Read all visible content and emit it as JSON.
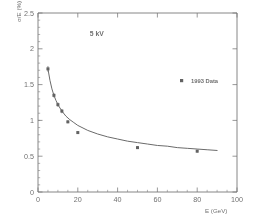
{
  "figure": {
    "axis_titles": {
      "y": "σ/E (%)",
      "x": "E  (GeV)"
    },
    "annotation": "5 kV",
    "legend": {
      "marker_icon": "filled-square-marker",
      "label": "1993 Data"
    },
    "colors": {
      "frame": "#3a3a3a",
      "curve": "#262626",
      "marker": "#1a1a1a",
      "background": "#ffffff"
    }
  },
  "chart_data": {
    "type": "scatter",
    "title": "",
    "subtitle": "",
    "xlabel": "E  (GeV)",
    "ylabel": "σ/E (%)",
    "xlim": [
      0,
      100
    ],
    "ylim": [
      0,
      2.5
    ],
    "grid": false,
    "legend_position": "upper-right-inside",
    "xticks": [
      0,
      20,
      40,
      60,
      80,
      100
    ],
    "xtick_labels": [
      "0",
      "20",
      "40",
      "60",
      "80",
      "100"
    ],
    "xtick_minor_step": 5,
    "yticks": [
      0,
      0.5,
      1,
      1.5,
      2,
      2.5
    ],
    "ytick_labels": [
      "0",
      "0.5",
      "1",
      "1.5",
      "2",
      "2.5"
    ],
    "ytick_minor_step": 0.1,
    "annotations": [
      {
        "text": "5 kV",
        "x": 26,
        "y": 2.18
      }
    ],
    "series": [
      {
        "name": "1993 Data",
        "type": "scatter",
        "marker": "square",
        "x": [
          5,
          8,
          10,
          12,
          15,
          20,
          50,
          80
        ],
        "y": [
          1.72,
          1.35,
          1.22,
          1.13,
          0.98,
          0.83,
          0.62,
          0.57
        ],
        "yerr": [
          0.04,
          0.03,
          0.03,
          0.03,
          0.02,
          0.02,
          0.02,
          0.02
        ]
      },
      {
        "name": "Fit curve",
        "type": "line",
        "model": "a/sqrt(E) + b",
        "x": [
          5,
          6,
          7,
          8,
          9,
          10,
          12,
          14,
          16,
          18,
          20,
          25,
          30,
          35,
          40,
          45,
          50,
          55,
          60,
          65,
          70,
          75,
          80,
          85,
          90
        ],
        "y": [
          1.72,
          1.56,
          1.44,
          1.35,
          1.28,
          1.22,
          1.13,
          1.06,
          1.01,
          0.97,
          0.93,
          0.86,
          0.81,
          0.77,
          0.74,
          0.71,
          0.69,
          0.67,
          0.65,
          0.64,
          0.62,
          0.61,
          0.6,
          0.59,
          0.58
        ]
      }
    ]
  }
}
